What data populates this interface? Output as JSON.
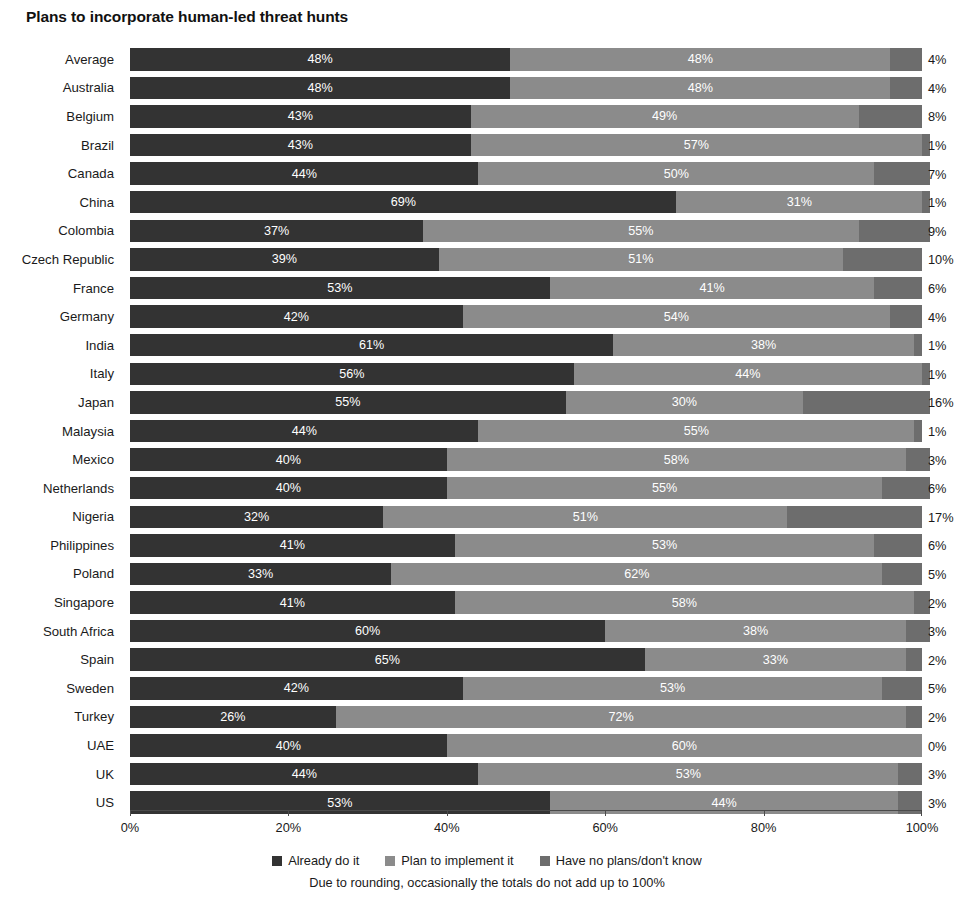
{
  "chart_data": {
    "type": "bar",
    "subtype": "stacked-horizontal-100",
    "title": "Plans to incorporate human-led threat hunts",
    "xlabel": "",
    "ylabel": "",
    "xlim": [
      0,
      100
    ],
    "xticks": [
      "0%",
      "20%",
      "40%",
      "60%",
      "80%",
      "100%"
    ],
    "xtick_values": [
      0,
      20,
      40,
      60,
      80,
      100
    ],
    "grid": false,
    "legend_position": "bottom",
    "footnote": "Due to rounding, occasionally the totals do not add up to 100%",
    "categories": [
      "Average",
      "Australia",
      "Belgium",
      "Brazil",
      "Canada",
      "China",
      "Colombia",
      "Czech Republic",
      "France",
      "Germany",
      "India",
      "Italy",
      "Japan",
      "Malaysia",
      "Mexico",
      "Netherlands",
      "Nigeria",
      "Philippines",
      "Poland",
      "Singapore",
      "South Africa",
      "Spain",
      "Sweden",
      "Turkey",
      "UAE",
      "UK",
      "US"
    ],
    "series": [
      {
        "name": "Already do it",
        "color": "#333333",
        "values": [
          48,
          48,
          43,
          43,
          44,
          69,
          37,
          39,
          53,
          42,
          61,
          56,
          55,
          44,
          40,
          40,
          32,
          41,
          33,
          41,
          60,
          65,
          42,
          26,
          40,
          44,
          53
        ],
        "labels": [
          "48%",
          "48%",
          "43%",
          "43%",
          "44%",
          "69%",
          "37%",
          "39%",
          "53%",
          "42%",
          "61%",
          "56%",
          "55%",
          "44%",
          "40%",
          "40%",
          "32%",
          "41%",
          "33%",
          "41%",
          "60%",
          "65%",
          "42%",
          "26%",
          "40%",
          "44%",
          "53%"
        ]
      },
      {
        "name": "Plan to implement it",
        "color": "#8b8b8b",
        "values": [
          48,
          48,
          49,
          57,
          50,
          31,
          55,
          51,
          41,
          54,
          38,
          44,
          30,
          55,
          58,
          55,
          51,
          53,
          62,
          58,
          38,
          33,
          53,
          72,
          60,
          53,
          44
        ],
        "labels": [
          "48%",
          "48%",
          "49%",
          "57%",
          "50%",
          "31%",
          "55%",
          "51%",
          "41%",
          "54%",
          "38%",
          "44%",
          "30%",
          "55%",
          "58%",
          "55%",
          "51%",
          "53%",
          "62%",
          "58%",
          "38%",
          "33%",
          "53%",
          "72%",
          "60%",
          "53%",
          "44%"
        ]
      },
      {
        "name": "Have no plans/don't know",
        "color": "#6d6d6d",
        "values": [
          4,
          4,
          8,
          1,
          7,
          1,
          9,
          10,
          6,
          4,
          1,
          1,
          16,
          1,
          3,
          6,
          17,
          6,
          5,
          2,
          3,
          2,
          5,
          2,
          0,
          3,
          3
        ],
        "labels": [
          "4%",
          "4%",
          "8%",
          "1%",
          "7%",
          "1%",
          "9%",
          "10%",
          "6%",
          "4%",
          "1%",
          "1%",
          "16%",
          "1%",
          "3%",
          "6%",
          "17%",
          "6%",
          "5%",
          "2%",
          "3%",
          "2%",
          "5%",
          "2%",
          "0%",
          "3%",
          "3%"
        ]
      }
    ]
  }
}
